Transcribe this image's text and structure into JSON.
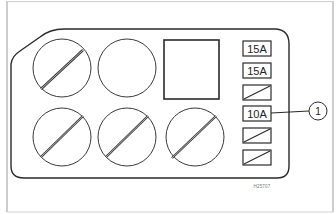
{
  "diagram": {
    "relays_row1": [
      {
        "id": "relay-1",
        "state": "slashed"
      },
      {
        "id": "relay-2",
        "state": "empty"
      }
    ],
    "module": {
      "id": "square-module"
    },
    "relays_row2": [
      {
        "id": "relay-3",
        "state": "slashed"
      },
      {
        "id": "relay-4",
        "state": "slashed"
      },
      {
        "id": "relay-5",
        "state": "slashed"
      }
    ],
    "fuses": [
      {
        "label": "15A"
      },
      {
        "label": "15A"
      },
      {
        "label": "",
        "blank": true
      },
      {
        "label": "10A"
      },
      {
        "label": "",
        "blank": true
      },
      {
        "label": "",
        "blank": true
      }
    ],
    "callout": {
      "number": "1",
      "points_to_fuse_index": 3
    },
    "figure_code": "H25707",
    "colors": {
      "line": "#2a2a2a",
      "frame": "#9a9a9a",
      "background": "#ffffff"
    }
  }
}
